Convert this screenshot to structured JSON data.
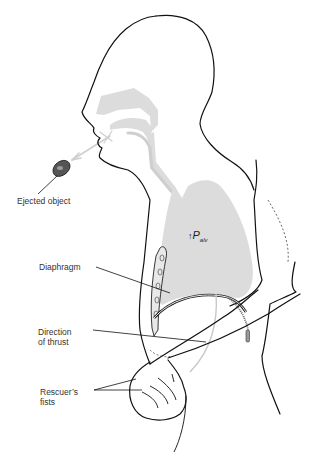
{
  "figure": {
    "type": "anatomical-illustration",
    "colors": {
      "outline": "#111111",
      "airway_fill": "#dcdcdc",
      "label_text": "#333333",
      "airflow_arrow": "#c8c8c8"
    }
  },
  "labels": {
    "ejected_object": "Ejected object",
    "diaphragm": "Diaphragm",
    "direction_of_thrust_line1": "Direction",
    "direction_of_thrust_line2": "of thrust",
    "rescuers_fists_line1": "Rescuer’s",
    "rescuers_fists_line2": "fists",
    "palv_arrow": "↑",
    "palv_symbol": "P",
    "palv_subscript": "alv"
  }
}
